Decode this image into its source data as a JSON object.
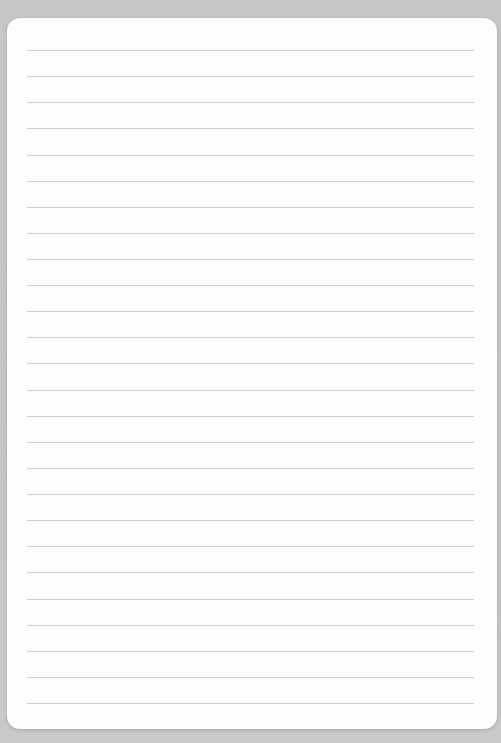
{
  "page": {
    "type": "blank-ruled-notebook-page",
    "title": "",
    "text_content": "",
    "line_count": 26,
    "colors": {
      "background_gray": "#c8c7c5",
      "paper_white": "#fdfdfc",
      "rule_line": "#c6c6c4"
    }
  }
}
